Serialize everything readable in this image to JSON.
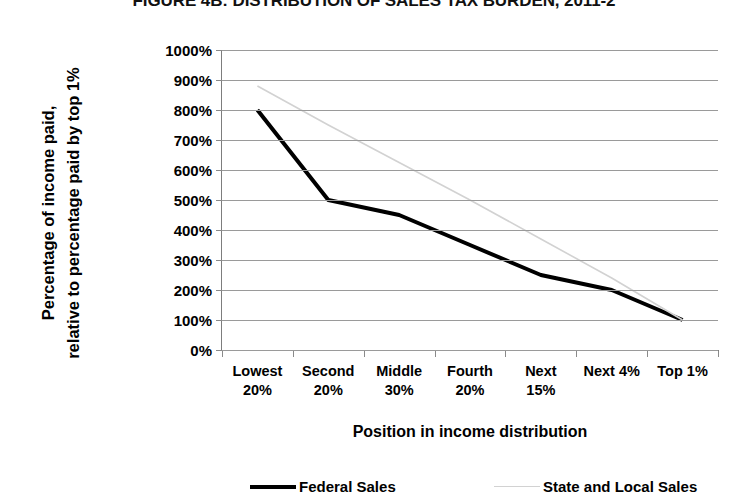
{
  "chart_data": {
    "type": "line",
    "title": "FIGURE 4B: DISTRIBUTION OF SALES TAX BURDEN, 2011-2",
    "xlabel": "Position in income distribution",
    "ylabel_line1": "Percentage of income paid,",
    "ylabel_line2": "relative to percentage paid by top 1%",
    "categories": [
      "Lowest\n20%",
      "Second\n20%",
      "Middle\n30%",
      "Fourth\n20%",
      "Next\n15%",
      "Next 4%",
      "Top 1%"
    ],
    "categories_flat": [
      "Lowest 20%",
      "Second 20%",
      "Middle 30%",
      "Fourth 20%",
      "Next 15%",
      "Next 4%",
      "Top 1%"
    ],
    "series": [
      {
        "name": "Federal Sales",
        "color": "#000000",
        "width": 4,
        "values": [
          800,
          500,
          450,
          350,
          250,
          200,
          100
        ]
      },
      {
        "name": "State and Local Sales",
        "color": "#d2d2d2",
        "width": 1.6,
        "values": [
          880,
          750,
          625,
          500,
          370,
          240,
          100
        ]
      }
    ],
    "ylim": [
      0,
      1000
    ],
    "ytick_values": [
      0,
      100,
      200,
      300,
      400,
      500,
      600,
      700,
      800,
      900,
      1000
    ],
    "ytick_labels": [
      "0%",
      "100%",
      "200%",
      "300%",
      "400%",
      "500%",
      "600%",
      "700%",
      "800%",
      "900%",
      "1000%"
    ],
    "grid": true,
    "grid_axis": "y",
    "legend_position": "bottom",
    "legend": [
      {
        "label": "Federal Sales",
        "style": "thick",
        "color": "#000000"
      },
      {
        "label": "State and Local Sales",
        "style": "thin",
        "color": "#d2d2d2"
      }
    ]
  }
}
